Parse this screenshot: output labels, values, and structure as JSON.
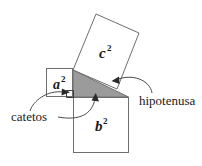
{
  "figure": {
    "background_color": "#ffffff",
    "outline_color": "#6e6e6e",
    "triangle_fill_color": "#9b9b9b",
    "leader_color": "#4a4a4a",
    "text_color": "#1a1a1a",
    "squares": [
      {
        "id": "square-a",
        "base": "a",
        "exponent": "2",
        "label": "a²",
        "position": "left",
        "fill": "#ffffff"
      },
      {
        "id": "square-b",
        "base": "b",
        "exponent": "2",
        "label": "b²",
        "position": "bottom",
        "fill": "#ffffff"
      },
      {
        "id": "square-c",
        "base": "c",
        "exponent": "2",
        "label": "c²",
        "position": "top-tilted",
        "fill": "#ffffff"
      }
    ],
    "annotations": [
      {
        "id": "annotation-catetos",
        "label": "catetos",
        "points_to": [
          "cateto-vertical",
          "cateto-horizontal"
        ],
        "arrow_count": 2
      },
      {
        "id": "annotation-hipotenusa",
        "label": "hipotenusa",
        "points_to": [
          "hypotenuse-edge"
        ],
        "arrow_count": 1
      }
    ],
    "triangle": {
      "id": "right-triangle",
      "fill": "#9b9b9b",
      "has_right_angle_marker": true
    }
  }
}
